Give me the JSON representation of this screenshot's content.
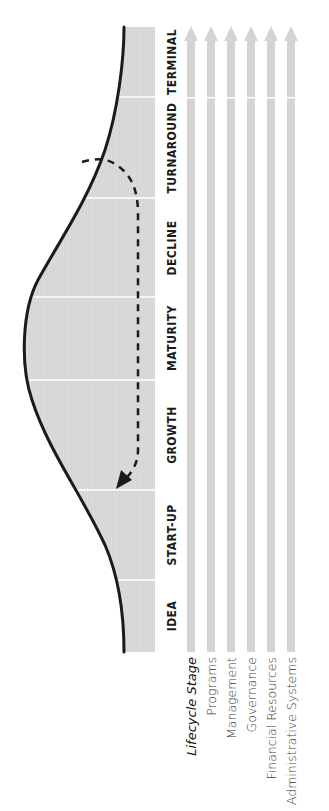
{
  "diagram": {
    "orientation": "rotated-90-ccw",
    "colors": {
      "band_fill": "#d9d9d9",
      "band_divider": "#ffffff",
      "curve": "#1a1a1a",
      "arrow_fill": "#d4d4d4",
      "stage_text": "#1a1a1a",
      "row_text": "#3a3a3a"
    },
    "stages": [
      {
        "label": "IDEA",
        "y_start": 580,
        "y_end": 652
      },
      {
        "label": "START-UP",
        "y_start": 490,
        "y_end": 580
      },
      {
        "label": "GROWTH",
        "y_start": 380,
        "y_end": 490
      },
      {
        "label": "MATURITY",
        "y_start": 297,
        "y_end": 380
      },
      {
        "label": "DECLINE",
        "y_start": 198,
        "y_end": 297
      },
      {
        "label": "TURNAROUND",
        "y_start": 97,
        "y_end": 198
      },
      {
        "label": "TERMINAL",
        "y_start": 27,
        "y_end": 97
      }
    ],
    "row_labels": [
      {
        "label": "Lifecycle Stage",
        "style": "title"
      },
      {
        "label": "Programs"
      },
      {
        "label": "Management"
      },
      {
        "label": "Governance"
      },
      {
        "label": "Financial Resources"
      },
      {
        "label": "Administrative Systems"
      }
    ],
    "arrows_count": 6,
    "curve": {
      "description": "Bell-shaped lifecycle curve: rises from Idea, peaks at Maturity, falls through Decline to Terminal",
      "peak_stage": "MATURITY"
    },
    "turnaround_path": {
      "description": "Dashed arrow from Turnaround looping back to Growth/Start-up boundary",
      "from_stage": "TURNAROUND",
      "to_stage": "START-UP"
    }
  }
}
